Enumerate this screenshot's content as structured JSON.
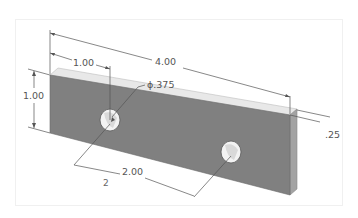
{
  "drawing": {
    "title": "Isometric plate with two holes",
    "colors": {
      "front_face": "#7d7d7d",
      "top_face": "#e8e8e8",
      "side_face": "#9a9a9a",
      "dimension_line": "#555555",
      "hole_inner": "#f4f4f4"
    },
    "dimensions": {
      "overall_length": "4.00",
      "hole_offset": "1.00",
      "height": "1.00",
      "hole_diameter": "ϕ.375",
      "thickness": ".25",
      "hole_spacing": "2.00",
      "note": "2"
    }
  }
}
